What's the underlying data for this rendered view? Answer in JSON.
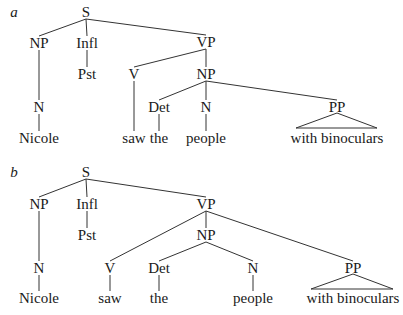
{
  "trees": [
    {
      "tag": "a",
      "tag_pos": [
        14,
        12
      ],
      "nodes": [
        {
          "id": "S",
          "label": "S",
          "x": 86,
          "y": 12
        },
        {
          "id": "NP1",
          "label": "NP",
          "x": 39,
          "y": 43
        },
        {
          "id": "Infl",
          "label": "Infl",
          "x": 87,
          "y": 43
        },
        {
          "id": "VP",
          "label": "VP",
          "x": 206,
          "y": 42
        },
        {
          "id": "Pst",
          "label": "Pst",
          "x": 87,
          "y": 74
        },
        {
          "id": "V",
          "label": "V",
          "x": 134,
          "y": 74
        },
        {
          "id": "NP2",
          "label": "NP",
          "x": 206,
          "y": 74
        },
        {
          "id": "N1",
          "label": "N",
          "x": 39,
          "y": 107
        },
        {
          "id": "Det",
          "label": "Det",
          "x": 159,
          "y": 107
        },
        {
          "id": "N2",
          "label": "N",
          "x": 206,
          "y": 107
        },
        {
          "id": "PP",
          "label": "PP",
          "x": 337,
          "y": 107
        },
        {
          "id": "Nicole",
          "label": "Nicole",
          "x": 39,
          "y": 138
        },
        {
          "id": "saw",
          "label": "saw",
          "x": 134,
          "y": 138
        },
        {
          "id": "the",
          "label": "the",
          "x": 159,
          "y": 138
        },
        {
          "id": "people",
          "label": "people",
          "x": 206,
          "y": 138
        },
        {
          "id": "binoc",
          "label": "with binoculars",
          "x": 337,
          "y": 138
        }
      ],
      "edges": [
        [
          "S",
          "NP1"
        ],
        [
          "S",
          "Infl"
        ],
        [
          "S",
          "VP"
        ],
        [
          "NP1",
          "N1"
        ],
        [
          "N1",
          "Nicole"
        ],
        [
          "Infl",
          "Pst"
        ],
        [
          "VP",
          "V"
        ],
        [
          "VP",
          "NP2"
        ],
        [
          "V",
          "saw"
        ],
        [
          "NP2",
          "Det"
        ],
        [
          "NP2",
          "N2"
        ],
        [
          "NP2",
          "PP"
        ],
        [
          "Det",
          "the"
        ],
        [
          "N2",
          "people"
        ]
      ],
      "triangle": {
        "apex": [
          337,
          113
        ],
        "left": [
          296,
          128
        ],
        "right": [
          377,
          128
        ]
      }
    },
    {
      "tag": "b",
      "tag_pos": [
        14,
        172
      ],
      "nodes": [
        {
          "id": "S",
          "label": "S",
          "x": 86,
          "y": 172
        },
        {
          "id": "NP1",
          "label": "NP",
          "x": 39,
          "y": 204
        },
        {
          "id": "Infl",
          "label": "Infl",
          "x": 87,
          "y": 204
        },
        {
          "id": "VP",
          "label": "VP",
          "x": 206,
          "y": 204
        },
        {
          "id": "Pst",
          "label": "Pst",
          "x": 87,
          "y": 235
        },
        {
          "id": "NP2",
          "label": "NP",
          "x": 206,
          "y": 235
        },
        {
          "id": "N1",
          "label": "N",
          "x": 39,
          "y": 268
        },
        {
          "id": "V",
          "label": "V",
          "x": 110,
          "y": 268
        },
        {
          "id": "Det",
          "label": "Det",
          "x": 159,
          "y": 268
        },
        {
          "id": "N2",
          "label": "N",
          "x": 253,
          "y": 268
        },
        {
          "id": "PP",
          "label": "PP",
          "x": 353,
          "y": 268
        },
        {
          "id": "Nicole",
          "label": "Nicole",
          "x": 39,
          "y": 298
        },
        {
          "id": "saw",
          "label": "saw",
          "x": 110,
          "y": 298
        },
        {
          "id": "the",
          "label": "the",
          "x": 159,
          "y": 298
        },
        {
          "id": "people",
          "label": "people",
          "x": 253,
          "y": 298
        },
        {
          "id": "binoc",
          "label": "with binoculars",
          "x": 353,
          "y": 298
        }
      ],
      "edges": [
        [
          "S",
          "NP1"
        ],
        [
          "S",
          "Infl"
        ],
        [
          "S",
          "VP"
        ],
        [
          "NP1",
          "N1"
        ],
        [
          "N1",
          "Nicole"
        ],
        [
          "Infl",
          "Pst"
        ],
        [
          "VP",
          "V"
        ],
        [
          "VP",
          "NP2"
        ],
        [
          "VP",
          "PP"
        ],
        [
          "V",
          "saw"
        ],
        [
          "NP2",
          "Det"
        ],
        [
          "NP2",
          "N2"
        ],
        [
          "Det",
          "the"
        ],
        [
          "N2",
          "people"
        ]
      ],
      "triangle": {
        "apex": [
          353,
          274
        ],
        "left": [
          311,
          289
        ],
        "right": [
          393,
          289
        ]
      }
    }
  ]
}
